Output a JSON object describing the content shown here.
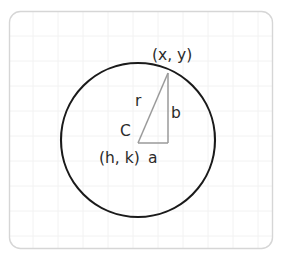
{
  "figure": {
    "background_color": "#ffffff",
    "panel_border_color": "#d6d6d6",
    "grid_color": "#f0f0f0",
    "circle_stroke_color": "#1a1a1a",
    "triangle_stroke_color": "#9a9a9a",
    "text_color": "#2b2b2b"
  },
  "labels": {
    "point_on_circle": "(x, y)",
    "center_letter": "C",
    "center_coords": "(h, k)",
    "radius": "r",
    "horizontal_leg": "a",
    "vertical_leg": "b"
  },
  "geometry": {
    "circle": {
      "cx": 138,
      "cy": 140,
      "r": 77
    },
    "center_point": {
      "x": 138,
      "y": 143
    },
    "circle_point": {
      "x": 168,
      "y": 73
    },
    "right_angle_corner": {
      "x": 168,
      "y": 143
    }
  }
}
